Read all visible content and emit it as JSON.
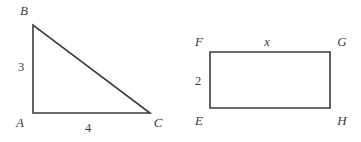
{
  "canvas": {
    "width": 361,
    "height": 142,
    "background": "#ffffff",
    "stroke_color": "#3b3b3b",
    "text_color": "#3b3b3b"
  },
  "figures": [
    {
      "id": "triangle-abc",
      "type": "right-triangle",
      "vertices": [
        {
          "name": "A",
          "label": "A",
          "x": 33,
          "y": 113,
          "label_x": 20,
          "label_y": 124
        },
        {
          "name": "B",
          "label": "B",
          "x": 33,
          "y": 25,
          "label_x": 24,
          "label_y": 12
        },
        {
          "name": "C",
          "label": "C",
          "x": 150,
          "y": 113,
          "label_x": 158,
          "label_y": 124
        }
      ],
      "path": "M 33 25 L 33 113 L 150 113 Z",
      "side_labels": [
        {
          "name": "leg-ab",
          "text": "3",
          "italic": false,
          "x": 21,
          "y": 68
        },
        {
          "name": "leg-ac",
          "text": "4",
          "italic": false,
          "x": 88,
          "y": 129
        }
      ]
    },
    {
      "id": "rectangle-efgh",
      "type": "rectangle",
      "vertices": [
        {
          "name": "F",
          "label": "F",
          "x": 210,
          "y": 52,
          "label_x": 199,
          "label_y": 43
        },
        {
          "name": "G",
          "label": "G",
          "x": 330,
          "y": 52,
          "label_x": 342,
          "label_y": 43
        },
        {
          "name": "H",
          "label": "H",
          "x": 330,
          "y": 108,
          "label_x": 342,
          "label_y": 122
        },
        {
          "name": "E",
          "label": "E",
          "x": 210,
          "y": 108,
          "label_x": 199,
          "label_y": 122
        }
      ],
      "path": "M 210 52 L 330 52 L 330 108 L 210 108 Z",
      "side_labels": [
        {
          "name": "side-fg",
          "text": "x",
          "italic": true,
          "x": 267,
          "y": 43
        },
        {
          "name": "side-ef",
          "text": "2",
          "italic": false,
          "x": 198,
          "y": 82
        }
      ]
    }
  ]
}
